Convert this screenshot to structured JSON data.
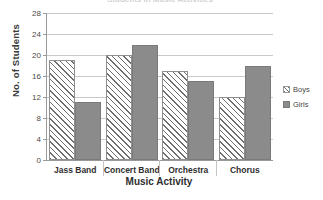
{
  "chart_data": {
    "type": "bar",
    "title": "Students in Music Activities",
    "xlabel": "Music Activity",
    "ylabel": "No. of Students",
    "categories": [
      "Jass Band",
      "Concert Band",
      "Orchestra",
      "Chorus"
    ],
    "series": [
      {
        "name": "Boys",
        "values": [
          19,
          20,
          17,
          12
        ],
        "pattern": "diagonal-hatch",
        "color": "#6e6e6e"
      },
      {
        "name": "Girls",
        "values": [
          11,
          22,
          15,
          18
        ],
        "pattern": "stipple",
        "color": "#8b8b8b"
      }
    ],
    "ylim": [
      0,
      28
    ],
    "yticks": [
      0,
      4,
      8,
      12,
      16,
      20,
      24,
      28
    ],
    "grid": true,
    "legend_position": "right"
  },
  "legend": {
    "items": [
      {
        "label": "Boys",
        "swatch": "diagonal-hatch-swatch"
      },
      {
        "label": "Girls",
        "swatch": "stipple-swatch"
      }
    ]
  }
}
